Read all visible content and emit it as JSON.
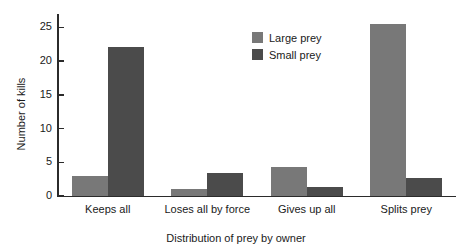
{
  "chart_data": {
    "type": "bar",
    "title": "",
    "categories": [
      "Keeps all",
      "Loses all by force",
      "Gives up all",
      "Splits prey"
    ],
    "series": [
      {
        "name": "Large prey",
        "color": "#787878",
        "values": [
          3.0,
          1.1,
          4.3,
          25.5
        ]
      },
      {
        "name": "Small prey",
        "color": "#4b4b4b",
        "values": [
          22.1,
          3.4,
          1.3,
          2.7
        ]
      }
    ],
    "xlabel": "Distribution of prey by owner",
    "ylabel": "Number of kills",
    "ylim": [
      0,
      27
    ],
    "yticks": [
      0,
      5,
      10,
      15,
      20,
      25
    ],
    "ytick_labels": [
      "0",
      "5",
      "10",
      "15",
      "20",
      "25"
    ],
    "grid": false,
    "legend_position": "top-center-right"
  },
  "legend": {
    "items": [
      {
        "label": "Large prey",
        "color": "#787878"
      },
      {
        "label": "Small prey",
        "color": "#4b4b4b"
      }
    ]
  },
  "axes": {
    "y_label": "Number of kills",
    "x_label": "Distribution of prey by owner"
  }
}
